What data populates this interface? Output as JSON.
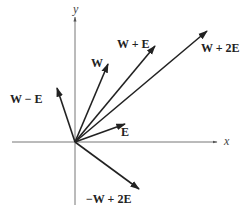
{
  "diagram": {
    "origin": [
      75,
      142
    ],
    "axes": {
      "x": {
        "label": "x",
        "from": [
          12,
          142
        ],
        "to": [
          217,
          142
        ],
        "label_pos": [
          224,
          145
        ]
      },
      "y": {
        "label": "y",
        "from": [
          75,
          205
        ],
        "to": [
          75,
          17
        ],
        "label_pos": [
          73,
          13
        ]
      }
    },
    "vectors": [
      {
        "name": "W - E",
        "label": "W − E",
        "tip": [
          57,
          88
        ],
        "label_pos": [
          10,
          103
        ]
      },
      {
        "name": "W",
        "label": "W",
        "tip": [
          108,
          64
        ],
        "label_pos": [
          91,
          67
        ]
      },
      {
        "name": "W + E",
        "label": "W + E",
        "tip": [
          155,
          46
        ],
        "label_pos": [
          117,
          48
        ]
      },
      {
        "name": "W + 2E",
        "label": "W + 2E",
        "tip": [
          207,
          31
        ],
        "label_pos": [
          201,
          52
        ]
      },
      {
        "name": "E",
        "label": "E",
        "tip": [
          125,
          124
        ],
        "label_pos": [
          121,
          136
        ]
      },
      {
        "name": "-W + 2E",
        "label": "−W + 2E",
        "tip": [
          139,
          189
        ],
        "label_pos": [
          86,
          203
        ]
      }
    ],
    "colors": {
      "axis": "#777777",
      "vector": "#222222",
      "text": "#222222"
    }
  }
}
